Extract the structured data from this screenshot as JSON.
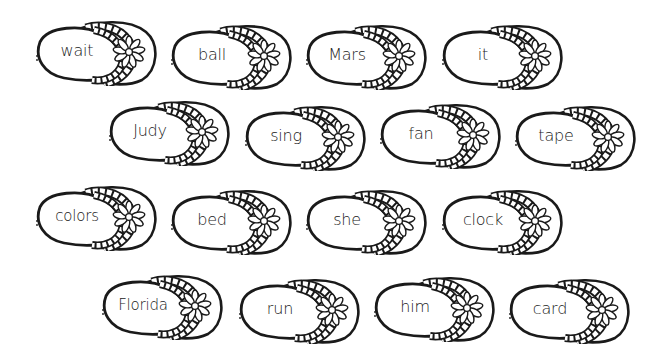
{
  "worksheet": {
    "rows": [
      {
        "cards": [
          {
            "word": "wait",
            "x": 34,
            "y": 18
          },
          {
            "word": "ball",
            "x": 169,
            "y": 22
          },
          {
            "word": "Mars",
            "x": 304,
            "y": 22
          },
          {
            "word": "it",
            "x": 440,
            "y": 22
          }
        ]
      },
      {
        "cards": [
          {
            "word": "Judy",
            "x": 107,
            "y": 98
          },
          {
            "word": "sing",
            "x": 243,
            "y": 103
          },
          {
            "word": "fan",
            "x": 378,
            "y": 101
          },
          {
            "word": "tape",
            "x": 513,
            "y": 103
          }
        ]
      },
      {
        "cards": [
          {
            "word": "colors",
            "x": 34,
            "y": 183
          },
          {
            "word": "bed",
            "x": 169,
            "y": 187
          },
          {
            "word": "she",
            "x": 304,
            "y": 187
          },
          {
            "word": "clock",
            "x": 440,
            "y": 187
          }
        ]
      },
      {
        "cards": [
          {
            "word": "Florida",
            "x": 100,
            "y": 272
          },
          {
            "word": "run",
            "x": 237,
            "y": 276
          },
          {
            "word": "him",
            "x": 372,
            "y": 274
          },
          {
            "word": "card",
            "x": 507,
            "y": 276
          }
        ]
      }
    ],
    "icon": "flip-flop-with-daisy-icon",
    "colors": {
      "outline": "#1a1a1a",
      "fill": "#ffffff",
      "text": "#222222"
    }
  }
}
